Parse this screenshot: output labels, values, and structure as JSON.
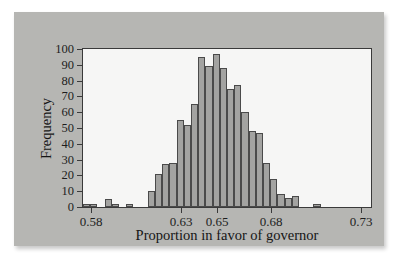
{
  "chart_data": {
    "type": "bar",
    "title": "",
    "subtitle": "",
    "xlabel": "Proportion in favor of governor",
    "ylabel": "Frequency",
    "xlim": [
      0.5755,
      0.7355
    ],
    "ylim": [
      0,
      100
    ],
    "grid": false,
    "legend": null,
    "bin_width": 0.004,
    "x_tick_labels": [
      "0.58",
      "0.63",
      "0.65",
      "0.68",
      "0.73"
    ],
    "x_tick_values": [
      0.58,
      0.63,
      0.65,
      0.68,
      0.73
    ],
    "y_tick_labels": [
      "0",
      "10",
      "20",
      "30",
      "40",
      "50",
      "60",
      "70",
      "80",
      "90",
      "100"
    ],
    "y_tick_values": [
      0,
      10,
      20,
      30,
      40,
      50,
      60,
      70,
      80,
      90,
      100
    ],
    "bin_starts": [
      0.5755,
      0.5795,
      0.5835,
      0.5875,
      0.5915,
      0.5955,
      0.5995,
      0.6035,
      0.6075,
      0.6115,
      0.6155,
      0.6195,
      0.6235,
      0.6275,
      0.6315,
      0.6355,
      0.6395,
      0.6435,
      0.6475,
      0.6515,
      0.6555,
      0.6595,
      0.6635,
      0.6675,
      0.6715,
      0.6755,
      0.6795,
      0.6835,
      0.6875,
      0.6915,
      0.6955,
      0.6995,
      0.7035,
      0.7075,
      0.7115,
      0.7155,
      0.7195,
      0.7235,
      0.7275,
      0.7315
    ],
    "values": [
      2,
      2,
      0,
      5,
      2,
      0,
      2,
      0,
      0,
      10,
      21,
      27,
      28,
      55,
      52,
      65,
      95,
      89,
      97,
      88,
      75,
      77,
      60,
      48,
      47,
      28,
      18,
      8,
      6,
      7,
      0,
      0,
      2
    ],
    "colors": {
      "bar_fill": "#a3a3a1",
      "bar_edge": "#4a4a4a",
      "plot_background": "#f6f6f5",
      "panel_background": "#b6b6b3",
      "page_background": "#ffffff",
      "axis": "#3a3a3a",
      "text": "#1d1d1d"
    }
  }
}
